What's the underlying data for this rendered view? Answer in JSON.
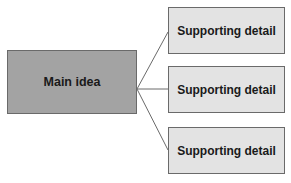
{
  "diagram": {
    "main": {
      "label": "Main idea",
      "fill": "#a3a3a3"
    },
    "details": [
      {
        "label": "Supporting detail",
        "fill": "#e3e3e3"
      },
      {
        "label": "Supporting detail",
        "fill": "#e3e3e3"
      },
      {
        "label": "Supporting detail",
        "fill": "#e3e3e3"
      }
    ],
    "connector_color": "#6a6a6a"
  }
}
